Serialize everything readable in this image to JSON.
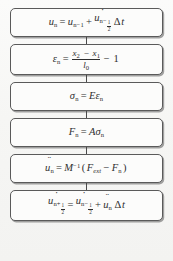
{
  "diagram": {
    "type": "flowchart",
    "orientation": "vertical",
    "box_count": 6,
    "connector_count": 5,
    "style": {
      "box_fill": "#fcfcfb",
      "box_border": "#5a5a5a",
      "background": "#f7f7f5",
      "text_color": "#2e2e2e"
    },
    "steps": [
      {
        "id": "displacement-update",
        "equation_text": "u_n = u_{n-1} + u̇_{n-1/2} Δt",
        "lhs": {
          "symbol": "u",
          "dots": 1,
          "subscript": "n"
        },
        "terms": [
          {
            "symbol": "u",
            "dots": 0,
            "subscript": "n-1"
          },
          {
            "symbol": "u",
            "dots": 1,
            "subscript": "n-1/2",
            "factor": "Δt"
          }
        ]
      },
      {
        "id": "strain-update",
        "equation_text": "ε_n = (x_2 - x_1)/l_0 - 1",
        "lhs": {
          "symbol": "ε",
          "subscript": "n"
        },
        "numerator": "x_2 - x_1",
        "denominator": "l_0",
        "offset": "1"
      },
      {
        "id": "stress-update",
        "equation_text": "σ_n = E ε_n",
        "lhs": {
          "symbol": "σ",
          "subscript": "n"
        },
        "modulus": "E",
        "strain": {
          "symbol": "ε",
          "subscript": "n"
        }
      },
      {
        "id": "force-update",
        "equation_text": "F_n = A σ_n",
        "lhs": {
          "symbol": "F",
          "subscript": "n"
        },
        "area": "A",
        "stress": {
          "symbol": "σ",
          "subscript": "n"
        }
      },
      {
        "id": "acceleration-update",
        "equation_text": "ü_n = M^{-1}(F_ext - F_n)",
        "lhs": {
          "symbol": "u",
          "dots": 2,
          "subscript": "n"
        },
        "mass_inverse": "M",
        "exponent": "-1",
        "external_force": {
          "symbol": "F",
          "subscript": "ext"
        },
        "internal_force": {
          "symbol": "F",
          "subscript": "n"
        }
      },
      {
        "id": "velocity-update",
        "equation_text": "u̇_{n+1/2} = u̇_{n-1/2} + ü_n Δt",
        "lhs": {
          "symbol": "u",
          "dots": 1,
          "subscript": "n+1/2"
        },
        "terms": [
          {
            "symbol": "u",
            "dots": 1,
            "subscript": "n-1/2"
          },
          {
            "symbol": "u",
            "dots": 2,
            "subscript": "n",
            "factor": "Δt"
          }
        ]
      }
    ],
    "glyphs": {
      "u": "u",
      "n": "n",
      "n_minus_1": "n−1",
      "n_minus": "n−",
      "n_plus": "n+",
      "one": "1",
      "two": "2",
      "epsilon": "ε",
      "sigma": "σ",
      "delta": "Δ",
      "t": "t",
      "x": "x",
      "l": "l",
      "zero": "0",
      "E": "E",
      "F": "F",
      "A": "A",
      "M": "M",
      "ext": "ext",
      "equals": "=",
      "plus": "+",
      "minus": "−",
      "minus_one": "−1",
      "paren_open": "(",
      "paren_close": ")"
    }
  }
}
